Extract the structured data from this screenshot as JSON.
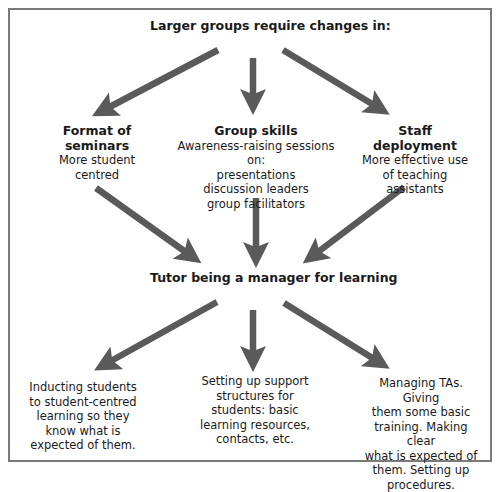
{
  "diagram": {
    "top": {
      "label": "Larger groups require changes in:"
    },
    "branches": [
      {
        "title": "Format of seminars",
        "title_lines": [
          "Format of",
          "seminars"
        ],
        "body_lines": [
          "More student",
          "centred"
        ]
      },
      {
        "title": "Group skills",
        "title_lines": [
          "Group skills"
        ],
        "body_lines": [
          "Awareness-raising sessions on:",
          "presentations",
          "discussion leaders",
          "group facilitators"
        ]
      },
      {
        "title": "Staff deployment",
        "title_lines": [
          "Staff deployment"
        ],
        "body_lines": [
          "More effective use",
          "of teaching",
          "assistants"
        ]
      }
    ],
    "center": {
      "label": "Tutor being a manager for learning"
    },
    "outcomes": [
      {
        "lines": [
          "Inducting students",
          "to student-centred",
          "learning so they",
          "know what is",
          "expected of them."
        ]
      },
      {
        "lines": [
          "Setting up support",
          "structures for",
          "students: basic",
          "learning resources,",
          "contacts, etc."
        ]
      },
      {
        "lines": [
          "Managing TAs. Giving",
          "them some basic",
          "training. Making clear",
          "what is expected of",
          "them. Setting up",
          "procedures."
        ]
      }
    ],
    "colors": {
      "arrow": "#5a5a5a",
      "frame": "#7a7a7a",
      "text": "#1a1a1a",
      "background": "#ffffff"
    }
  }
}
